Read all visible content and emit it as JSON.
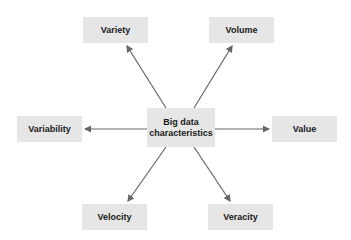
{
  "diagram": {
    "center": {
      "line1": "Big data",
      "line2": "characteristics"
    },
    "nodes": [
      {
        "id": "variety",
        "label": "Variety"
      },
      {
        "id": "volume",
        "label": "Volume"
      },
      {
        "id": "variability",
        "label": "Variability"
      },
      {
        "id": "value",
        "label": "Value"
      },
      {
        "id": "velocity",
        "label": "Velocity"
      },
      {
        "id": "veracity",
        "label": "Veracity"
      }
    ],
    "colors": {
      "box": "#e6e6e6",
      "arrow": "#666666",
      "text": "#1a1a1a"
    }
  }
}
